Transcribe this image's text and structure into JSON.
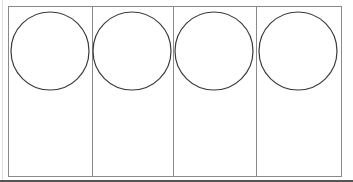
{
  "diagram": {
    "colors": {
      "outline": "#8a8a8a",
      "circle_stroke": "#3a3a3a",
      "divider": "#8a8a8a",
      "background": "#ffffff"
    },
    "outer_rect": {
      "x": 8,
      "y": 6,
      "width": 333,
      "height": 170
    },
    "panels": [
      {
        "x0": 8,
        "x1": 92,
        "circle": {
          "cx": 50,
          "cy": 51,
          "r": 39
        }
      },
      {
        "x0": 92,
        "x1": 173,
        "circle": {
          "cx": 132,
          "cy": 51,
          "r": 39
        }
      },
      {
        "x0": 173,
        "x1": 256,
        "circle": {
          "cx": 214,
          "cy": 51,
          "r": 39
        }
      },
      {
        "x0": 256,
        "x1": 341,
        "circle": {
          "cx": 298,
          "cy": 51,
          "r": 39
        }
      }
    ]
  }
}
